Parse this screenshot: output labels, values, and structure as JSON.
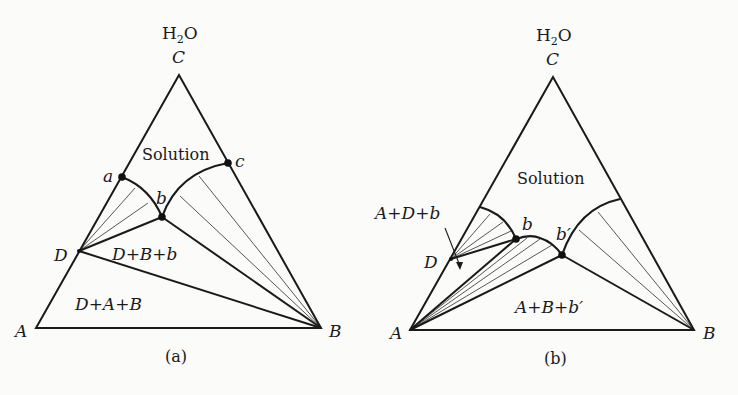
{
  "figure": {
    "panels": [
      {
        "caption": "(a)",
        "top_label": "H",
        "top_label_sub": "2",
        "top_label_tail": "O",
        "vertices": {
          "top": "C",
          "left": "A",
          "right": "B"
        },
        "points": {
          "a": "a",
          "b": "b",
          "c": "c",
          "D": "D"
        },
        "regions": {
          "solution": "Solution",
          "dbb": "D+B+b",
          "dab": "D+A+B"
        }
      },
      {
        "caption": "(b)",
        "top_label": "H",
        "top_label_sub": "2",
        "top_label_tail": "O",
        "vertices": {
          "top": "C",
          "left": "A",
          "right": "B"
        },
        "points": {
          "b": "b",
          "bprime": "b′",
          "D": "D"
        },
        "regions": {
          "solution": "Solution",
          "adb": "A+D+b",
          "abb": "A+B+b′"
        }
      }
    ]
  }
}
